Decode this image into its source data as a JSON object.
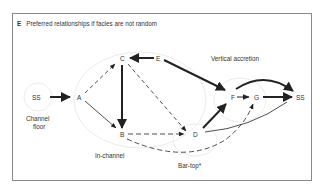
{
  "panel": {
    "letter": "E",
    "title": "Preferred relationships if facies are not random"
  },
  "nodes": {
    "ss_left": "SS",
    "a": "A",
    "b": "B",
    "c": "C",
    "d": "D",
    "e": "E",
    "f": "F",
    "g": "G",
    "ss_right": "SS"
  },
  "regions": {
    "channel_floor_line1": "Channel",
    "channel_floor_line2": "floor",
    "in_channel": "In-channel",
    "bar_top": "Bar-top*",
    "vertical_accretion": "Vertical accretion"
  },
  "edges": [
    {
      "from": "SS",
      "to": "A",
      "style": "solid-thick"
    },
    {
      "from": "A",
      "to": "C",
      "style": "dashed"
    },
    {
      "from": "A",
      "to": "B",
      "style": "solid-thin"
    },
    {
      "from": "C",
      "to": "B",
      "style": "solid-thick"
    },
    {
      "from": "E",
      "to": "C",
      "style": "solid-thick"
    },
    {
      "from": "C",
      "to": "D",
      "style": "dashed"
    },
    {
      "from": "E",
      "to": "F",
      "style": "solid-thick"
    },
    {
      "from": "B",
      "to": "D",
      "style": "dashed"
    },
    {
      "from": "D",
      "to": "F",
      "style": "solid-thick"
    },
    {
      "from": "F",
      "to": "G",
      "style": "solid-thin"
    },
    {
      "from": "G",
      "to": "SS",
      "style": "solid-thick"
    },
    {
      "from": "F",
      "to": "SS",
      "style": "solid-thick-curved"
    },
    {
      "from": "B",
      "to": "G",
      "style": "dashed-curved"
    },
    {
      "from": "D",
      "to": "SS",
      "style": "solid-thin-curved"
    }
  ],
  "colors": {
    "ink": "#222222",
    "frame": "#8a8a8a",
    "faint_circle": "#ececec"
  }
}
